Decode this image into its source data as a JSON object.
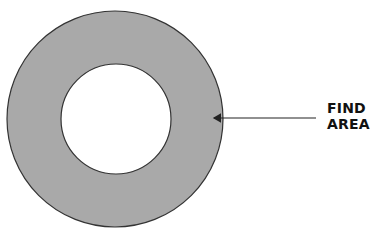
{
  "diagram": {
    "type": "annulus",
    "outer_circle": {
      "cx": 115,
      "cy": 119,
      "r": 108,
      "fill": "#a9a9a9",
      "stroke": "#333333"
    },
    "inner_circle": {
      "cx": 116,
      "cy": 119,
      "r": 55,
      "fill": "#ffffff",
      "stroke": "#333333"
    },
    "arrow": {
      "x1": 316,
      "y1": 118,
      "x2": 212,
      "y2": 118,
      "color": "#222222"
    },
    "label": {
      "line1": "FIND",
      "line2": "AREA"
    }
  }
}
